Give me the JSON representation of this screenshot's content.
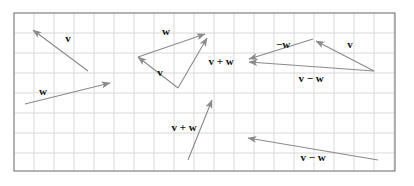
{
  "figure": {
    "canvas": {
      "width": 414,
      "height": 186,
      "background": "#ffffff"
    },
    "plot_frame": {
      "x": 14,
      "y": 13,
      "width": 381,
      "height": 158,
      "border_color": "#808080",
      "border_width": 1.2,
      "fill": "#ffffff"
    },
    "grid": {
      "visible": true,
      "spacing": 20,
      "color": "#d9d9d9",
      "line_width": 1
    },
    "arrow_style": {
      "color": "#8a8a8a",
      "line_width": 1.1,
      "head_color": "#8a8a8a",
      "head_length": 9,
      "head_width": 6
    },
    "arrows": [
      {
        "name": "v-upper-left",
        "x1": 88,
        "y1": 71,
        "x2": 33,
        "y2": 30
      },
      {
        "name": "w-lower-left",
        "x1": 25,
        "y1": 104,
        "x2": 110,
        "y2": 83
      },
      {
        "name": "w-middle-triangle",
        "x1": 138,
        "y1": 57,
        "x2": 205,
        "y2": 34
      },
      {
        "name": "v-middle-triangle",
        "x1": 178,
        "y1": 88,
        "x2": 138,
        "y2": 57
      },
      {
        "name": "v-plus-w-middle",
        "x1": 178,
        "y1": 88,
        "x2": 207,
        "y2": 38
      },
      {
        "name": "minus-w-right",
        "x1": 313,
        "y1": 39,
        "x2": 249,
        "y2": 59
      },
      {
        "name": "v-right-triangle",
        "x1": 374,
        "y1": 71,
        "x2": 316,
        "y2": 41
      },
      {
        "name": "v-minus-w-right",
        "x1": 374,
        "y1": 71,
        "x2": 249,
        "y2": 62
      },
      {
        "name": "v-plus-w-bottom",
        "x1": 188,
        "y1": 160,
        "x2": 212,
        "y2": 100
      },
      {
        "name": "v-minus-w-bottom",
        "x1": 378,
        "y1": 160,
        "x2": 248,
        "y2": 138
      }
    ],
    "labels": [
      {
        "name": "label-v-upper-left",
        "text": "v",
        "x": 68,
        "y": 39
      },
      {
        "name": "label-w-lower-left",
        "text": "w",
        "x": 43,
        "y": 92
      },
      {
        "name": "label-w-middle",
        "text": "w",
        "x": 166,
        "y": 32
      },
      {
        "name": "label-v-middle",
        "text": "v",
        "x": 160,
        "y": 73
      },
      {
        "name": "label-v-plus-w-middle",
        "text": "v + w",
        "x": 221,
        "y": 62
      },
      {
        "name": "label-minus-w-right",
        "text": "−w",
        "x": 283,
        "y": 45
      },
      {
        "name": "label-v-right",
        "text": "v",
        "x": 350,
        "y": 45
      },
      {
        "name": "label-v-minus-w-right",
        "text": "v − w",
        "x": 311,
        "y": 79
      },
      {
        "name": "label-v-plus-w-bottom",
        "text": "v + w",
        "x": 184,
        "y": 128
      },
      {
        "name": "label-v-minus-w-bottom",
        "text": "v − w",
        "x": 313,
        "y": 158
      }
    ]
  }
}
